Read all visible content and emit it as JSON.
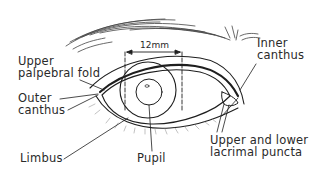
{
  "diagram": {
    "measurement": "12mm",
    "labels": {
      "upper_palpebral_fold": "Upper\npalpebral fold",
      "inner_canthus": "Inner\ncanthus",
      "outer_canthus": "Outer\ncanthus",
      "limbus": "Limbus",
      "pupil": "Pupil",
      "lacrimal_puncta": "Upper and lower\nlacrimal puncta"
    },
    "colors": {
      "line": "#1e1e1e",
      "background": "#ffffff",
      "text": "#2a2a2a"
    }
  }
}
